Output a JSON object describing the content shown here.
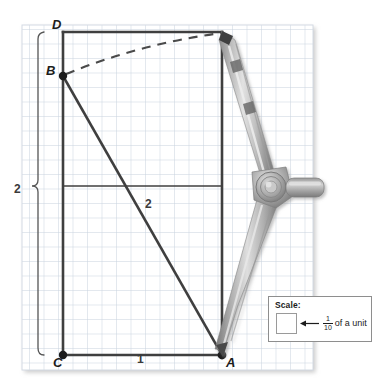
{
  "figure": {
    "type": "geometry-construction",
    "grid": {
      "cell_px": 14.5,
      "columns": 20,
      "rows": 24,
      "line_color": "#c8d2de",
      "panel_color": "#ffffff"
    },
    "points": [
      {
        "name": "A",
        "x": 222,
        "y": 355,
        "label": "A",
        "label_x": 227,
        "label_y": 358,
        "dot": true
      },
      {
        "name": "B",
        "x": 63,
        "y": 76,
        "label": "B",
        "label_x": 48,
        "label_y": 69,
        "dot": true
      },
      {
        "name": "C",
        "x": 63,
        "y": 355,
        "label": "C",
        "label_x": 55,
        "label_y": 358,
        "dot": true
      },
      {
        "name": "D",
        "x": 63,
        "y": 32,
        "label": "D",
        "label_x": 55,
        "label_y": 20,
        "dot": false
      }
    ],
    "segment_labels": [
      {
        "name": "diagonal-length",
        "text": "2",
        "x": 146,
        "y": 200
      },
      {
        "name": "base-length",
        "text": "1",
        "x": 138,
        "y": 356
      },
      {
        "name": "height-length",
        "text": "2",
        "x": 16,
        "y": 186
      }
    ],
    "stroke_color": "#3f3f3f",
    "dashed_arc": {
      "from": "B",
      "to": "top-right-corner",
      "style": "dashed"
    }
  },
  "scale_legend": {
    "title": "Scale:",
    "arrow": "left-arrow",
    "numerator": "1",
    "denominator": "10",
    "suffix": "of a unit"
  },
  "colors": {
    "grid_line": "#c8d2de",
    "figure_stroke": "#3f3f3f",
    "text": "#1c1c1c",
    "compass_metal_light": "#cfcfcf",
    "compass_metal_mid": "#a6a6a6",
    "compass_metal_dark": "#6e6e6e"
  }
}
